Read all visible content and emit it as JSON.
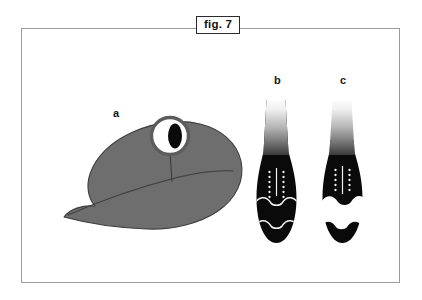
{
  "figure": {
    "caption_label": "fig. 7",
    "panels": [
      {
        "key": "a",
        "label": "a",
        "subject": "larval head in lateral view"
      },
      {
        "key": "b",
        "label": "b",
        "subject": "club-shaped tail, dark morph"
      },
      {
        "key": "c",
        "label": "c",
        "subject": "club-shaped tail, banded morph"
      }
    ]
  },
  "colors": {
    "frame_border": "#9b9b9b",
    "caption_border": "#2b2b2b",
    "background": "#ffffff",
    "head_body": "#6e6e6e",
    "head_outline": "#3d3d3d",
    "eye_ring": "#5c5c5c",
    "eye_sclera": "#ffffff",
    "eye_pupil": "#0a0a0a",
    "specimen_dark": "#0a0a0a",
    "specimen_light": "#ffffff",
    "specimen_marking": "#f2f2f2",
    "gradient_top": "#ffffff",
    "gradient_mid": "#9d9d9d"
  }
}
